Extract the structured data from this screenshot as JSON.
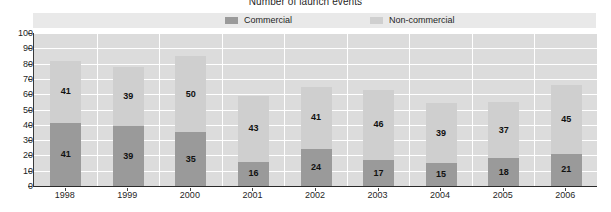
{
  "chart_data": {
    "type": "bar",
    "subtype": "stacked-vertical",
    "title": "Number of launch events",
    "xlabel": "",
    "ylabel": "",
    "ylim": [
      0,
      100
    ],
    "ytick_step": 10,
    "yticks": [
      100,
      90,
      80,
      70,
      60,
      50,
      40,
      30,
      20,
      10,
      0
    ],
    "grid": true,
    "grid_orientation": "both",
    "legend_position": "top-center",
    "categories": [
      "1998",
      "1999",
      "2000",
      "2001",
      "2002",
      "2003",
      "2004",
      "2005",
      "2006"
    ],
    "series": [
      {
        "name": "Commercial",
        "color": "#9a9a9a",
        "values": [
          41,
          39,
          35,
          16,
          24,
          17,
          15,
          18,
          21
        ]
      },
      {
        "name": "Non-commercial",
        "color": "#cfcfcf",
        "values": [
          41,
          39,
          50,
          43,
          41,
          46,
          39,
          37,
          45
        ]
      }
    ],
    "totals": [
      82,
      78,
      85,
      59,
      65,
      63,
      54,
      55,
      66
    ]
  },
  "colors": {
    "plot_background": "#dcdcdc",
    "gridline": "#ffffff",
    "axis": "#2a2a2a",
    "legend_background": "#e9e9e9",
    "commercial": "#9a9a9a",
    "non_commercial": "#cfcfcf",
    "text": "#1f1f1f"
  }
}
